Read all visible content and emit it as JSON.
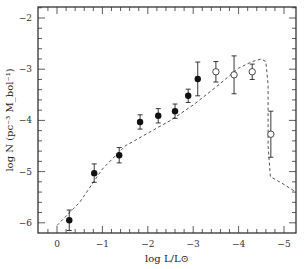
{
  "chart_data": {
    "type": "scatter",
    "title": "",
    "xlabel": "log L/L⊙",
    "ylabel": "log N (pc⁻³ M_bol⁻¹)",
    "xlim": [
      0.42,
      -5.3
    ],
    "ylim": [
      -6.2,
      -1.8
    ],
    "x_ticks": [
      0,
      -1,
      -2,
      -3,
      -4,
      -5
    ],
    "x_tick_labels": [
      "0",
      "−1",
      "−2",
      "−3",
      "−4",
      "−5"
    ],
    "y_ticks": [
      -2,
      -3,
      -4,
      -5,
      -6
    ],
    "y_tick_labels": [
      "−2",
      "−3",
      "−4",
      "−5",
      "−6"
    ],
    "grid": false,
    "legend": null,
    "series": [
      {
        "name": "filled points",
        "marker": "filled-circle",
        "x": [
          -0.27,
          -0.82,
          -1.37,
          -1.83,
          -2.23,
          -2.6,
          -2.89,
          -3.1
        ],
        "y": [
          -5.95,
          -5.03,
          -4.68,
          -4.03,
          -3.91,
          -3.82,
          -3.52,
          -3.19
        ],
        "yerr": [
          0.2,
          0.18,
          0.15,
          0.14,
          0.14,
          0.14,
          0.13,
          0.33
        ]
      },
      {
        "name": "open points",
        "marker": "open-circle",
        "x": [
          -3.5,
          -3.9,
          -4.3,
          -4.71
        ],
        "y": [
          -3.05,
          -3.11,
          -3.05,
          -4.27
        ],
        "yerr": [
          0.2,
          0.37,
          0.15,
          0.45
        ]
      },
      {
        "name": "model curve",
        "style": "dashed",
        "x": [
          0.0,
          -0.5,
          -1.0,
          -1.5,
          -2.0,
          -2.5,
          -3.0,
          -3.5,
          -4.0,
          -4.3,
          -4.5,
          -4.6,
          -4.65,
          -4.65,
          -4.7,
          -5.0,
          -5.3
        ],
        "y": [
          -6.05,
          -5.6,
          -4.95,
          -4.5,
          -4.25,
          -4.0,
          -3.7,
          -3.35,
          -2.98,
          -2.85,
          -2.8,
          -2.85,
          -3.3,
          -4.5,
          -5.1,
          -5.25,
          -5.4
        ]
      }
    ]
  }
}
